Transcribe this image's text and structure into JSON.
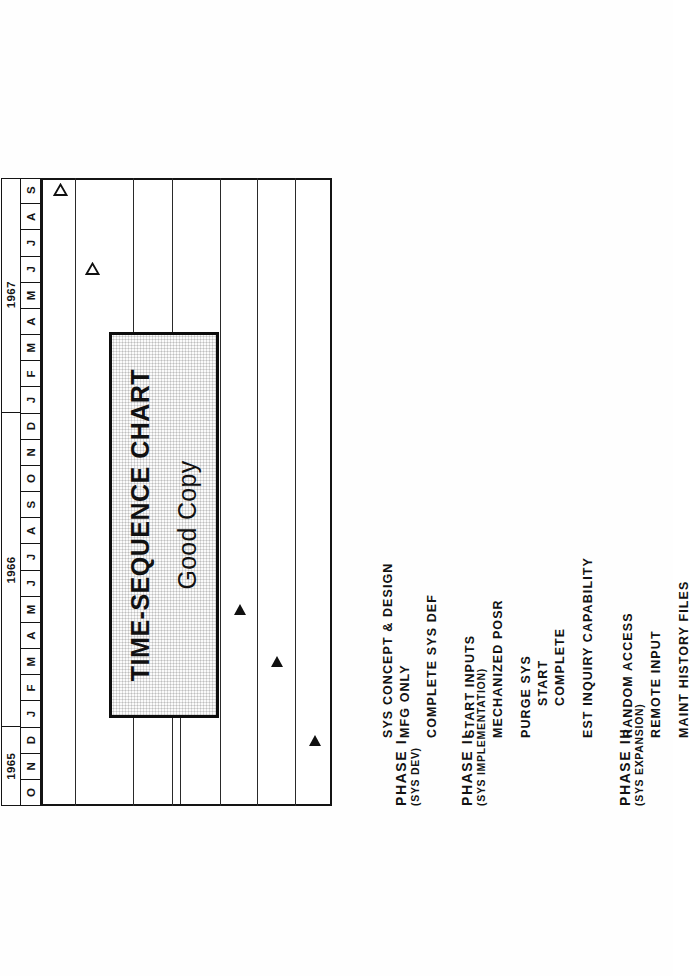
{
  "document": {
    "kind": "time-sequence-chart",
    "title_plate": {
      "line1": "TIME-SEQUENCE CHART",
      "line2": "Good Copy"
    }
  },
  "chart_data": {
    "type": "table",
    "title": "TIME-SEQUENCE CHART",
    "subtitle": "Good Copy",
    "orientation": "rotated-90-ccw",
    "xlabel": "",
    "ylabel": "",
    "grid": true,
    "legend": "",
    "time_axis": {
      "label": "",
      "years": [
        {
          "year": "1965",
          "months": [
            "O",
            "N",
            "D"
          ]
        },
        {
          "year": "1966",
          "months": [
            "J",
            "F",
            "M",
            "A",
            "M",
            "J",
            "J",
            "A",
            "S",
            "O",
            "N",
            "D"
          ]
        },
        {
          "year": "1967",
          "months": [
            "J",
            "F",
            "M",
            "A",
            "M",
            "J",
            "J",
            "A",
            "S"
          ]
        }
      ],
      "start": "1965-10",
      "end": "1967-09",
      "total_months": 24
    },
    "categories": [
      "PHASE I",
      "(SYS DEV)",
      "SYS CONCEPT & DESIGN",
      "MFG ONLY",
      "COMPLETE SYS DEF",
      "PHASE II",
      "(SYS IMPLEMENTATION)",
      "START INPUTS",
      "MECHANIZED POSR",
      "PURGE SYS",
      "START",
      "COMPLETE",
      "EST INQUIRY CAPABILITY",
      "PHASE III",
      "(SYS EXPANSION)",
      "RANDOM ACCESS",
      "REMOTE INPUT",
      "MAINT HISTORY FILES"
    ],
    "rows": [
      {
        "label": "PHASE I",
        "kind": "phase-heading",
        "milestone": null
      },
      {
        "label": "(SYS DEV)",
        "kind": "phase-subtitle",
        "milestone": null
      },
      {
        "label": "SYS CONCEPT & DESIGN",
        "kind": "task",
        "milestone": "1965-12"
      },
      {
        "label": "MFG ONLY",
        "kind": "task",
        "milestone": null
      },
      {
        "label": "COMPLETE SYS DEF",
        "kind": "task",
        "milestone": "1966-03"
      },
      {
        "label": "PHASE II",
        "kind": "phase-heading",
        "milestone": null
      },
      {
        "label": "(SYS IMPLEMENTATION)",
        "kind": "phase-subtitle",
        "milestone": null
      },
      {
        "label": "START INPUTS",
        "kind": "task",
        "milestone": "1966-05"
      },
      {
        "label": "MECHANIZED POSR",
        "kind": "task",
        "milestone": "1966-07"
      },
      {
        "label": "PURGE SYS",
        "kind": "task",
        "milestone": "1966-08"
      },
      {
        "label": "START",
        "kind": "task",
        "milestone": null
      },
      {
        "label": "COMPLETE",
        "kind": "task",
        "milestone": "1966-09"
      },
      {
        "label": "EST INQUIRY CAPABILITY",
        "kind": "task",
        "milestone": "1966-09"
      },
      {
        "label": "PHASE III",
        "kind": "phase-heading",
        "milestone": null
      },
      {
        "label": "(SYS EXPANSION)",
        "kind": "phase-subtitle",
        "milestone": null
      },
      {
        "label": "RANDOM ACCESS",
        "kind": "task",
        "milestone": null
      },
      {
        "label": "REMOTE INPUT",
        "kind": "task",
        "milestone": "1967-06",
        "marker": "open-triangle"
      },
      {
        "label": "MAINT HISTORY FILES",
        "kind": "task",
        "milestone": "1967-09",
        "marker": "open-triangle"
      }
    ],
    "markers": {
      "solid_triangle": "completed / scheduled milestone",
      "open_triangle": "future milestone"
    }
  },
  "labels": {
    "phase1": "PHASE I",
    "phase1_sub": "(SYS DEV)",
    "sys_concept": "SYS CONCEPT & DESIGN",
    "mfg_only": "MFG ONLY",
    "complete_sys_def": "COMPLETE SYS DEF",
    "phase2": "PHASE II",
    "phase2_sub": "(SYS IMPLEMENTATION)",
    "start_inputs": "START INPUTS",
    "mechanized_posr": "MECHANIZED POSR",
    "purge_sys": "PURGE SYS",
    "start": "START",
    "complete": "COMPLETE",
    "est_inquiry": "EST INQUIRY CAPABILITY",
    "phase3": "PHASE III",
    "phase3_sub": "(SYS EXPANSION)",
    "random_access": "RANDOM ACCESS",
    "remote_input": "REMOTE INPUT",
    "maint_history": "MAINT HISTORY FILES"
  },
  "axis": {
    "year_1965": "1965",
    "year_1966": "1966",
    "year_1967": "1967",
    "months_1965": [
      "O",
      "N",
      "D"
    ],
    "months_1966": [
      "J",
      "F",
      "M",
      "A",
      "M",
      "J",
      "J",
      "A",
      "S",
      "O",
      "N",
      "D"
    ],
    "months_1967": [
      "J",
      "F",
      "M",
      "A",
      "M",
      "J",
      "J",
      "A",
      "S"
    ]
  },
  "colors": {
    "ink": "#141414",
    "paper": "#ffffff",
    "plate_fill": "#fbfbfb"
  }
}
